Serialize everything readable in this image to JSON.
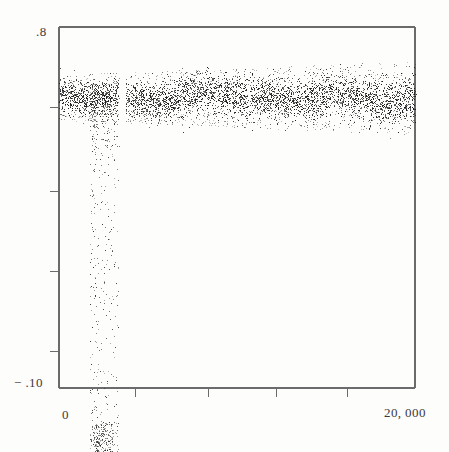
{
  "chart_data": {
    "type": "scatter",
    "title": "",
    "subtitle": "",
    "xlabel": "",
    "ylabel": "",
    "grid": false,
    "legend": null,
    "xlim": [
      0,
      20000
    ],
    "ylim": [
      -0.1,
      0.8
    ],
    "x_tick_labels": [
      "0",
      "20,000"
    ],
    "y_tick_labels": [
      ".8",
      "-.10"
    ],
    "x_tick_values": [
      0,
      20000
    ],
    "y_tick_values": [
      0.8,
      -0.1
    ],
    "x_unlabeled_tick_values": [
      4300,
      8400,
      12200,
      16200
    ],
    "y_unlabeled_tick_values": [
      0.6,
      0.39,
      0.19,
      -0.01
    ],
    "marker": "dot",
    "marker_size_px": 1,
    "color": "#1a1a1a",
    "series": [
      {
        "name": "main band",
        "description": "Dense horizontal noise band spanning the full x range, centered near 0.625 with spread of about +/-0.06",
        "n_points": 4200,
        "x_range": [
          0,
          20000
        ],
        "y_center": 0.625,
        "y_spread": 0.062,
        "gap_x_range": [
          3350,
          3750
        ]
      },
      {
        "name": "outlier streak",
        "description": "Narrow vertical column of scattered points near x = 1700-3350 dropping from the band down past the bottom of the axis",
        "n_points": 520,
        "x_range": [
          1700,
          3350
        ],
        "y_range": [
          -0.185,
          0.66
        ]
      }
    ]
  },
  "figure": {
    "background_color": "#fdfdfc",
    "axis_color": "#6b6b6b",
    "text_color": "#3a3a3a",
    "frame": {
      "left": 59,
      "right": 415,
      "top": 27,
      "bottom": 388
    }
  },
  "labels": {
    "y_top": ".8",
    "y_bottom": "− .10",
    "x_left": "0",
    "x_right": "20, 000"
  }
}
